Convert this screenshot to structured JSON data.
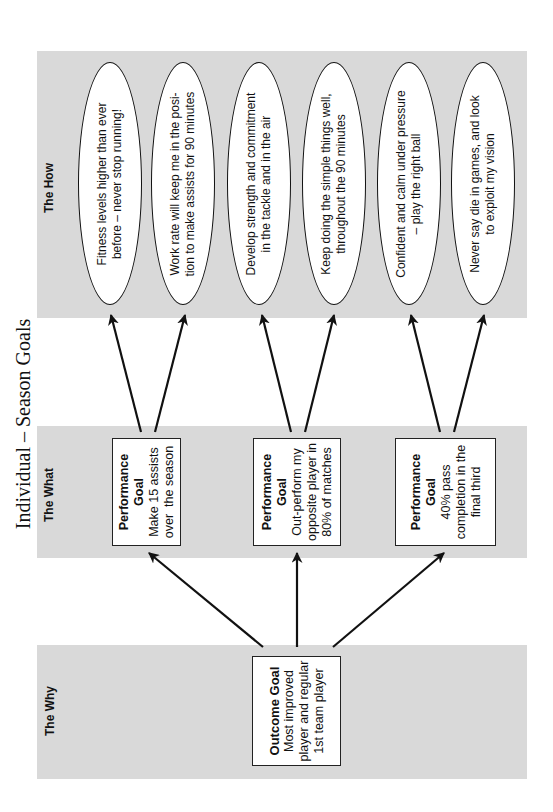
{
  "title": "Individual – Season Goals",
  "columns": {
    "how": {
      "label": "The How"
    },
    "what": {
      "label": "The What"
    },
    "why": {
      "label": "The Why"
    }
  },
  "how_items": [
    {
      "lines": [
        "Fitness levels higher than ever",
        "before – never stop running!"
      ]
    },
    {
      "lines": [
        "Work rate will keep me in the posi-",
        "tion to make assists for 90 minutes"
      ]
    },
    {
      "lines": [
        "Develop strength and commitment",
        "in the tackle and in the air"
      ]
    },
    {
      "lines": [
        "Keep doing the simple things well,",
        "throughout the 90 minutes"
      ]
    },
    {
      "lines": [
        "Confident and calm under pressure",
        "– play the right ball"
      ]
    },
    {
      "lines": [
        "Never say die in games, and look",
        "to exploit my vision"
      ]
    }
  ],
  "performance_goals": [
    {
      "heading": "Performance",
      "heading2": "Goal",
      "lines": [
        "Make 15 assists",
        "over  the season"
      ]
    },
    {
      "heading": "Performance",
      "heading2": "Goal",
      "lines": [
        "Out-perform my",
        "opposite player in",
        "80% of matches"
      ]
    },
    {
      "heading": "Performance",
      "heading2": "Goal",
      "lines": [
        "40% pass",
        "completion in the",
        "final third"
      ]
    }
  ],
  "outcome_goal": {
    "heading": "Outcome Goal",
    "lines": [
      "Most improved",
      "player and regular",
      "1st team player"
    ]
  },
  "colors": {
    "band": "#d9d9d9",
    "stroke": "#111111",
    "background": "#ffffff"
  }
}
